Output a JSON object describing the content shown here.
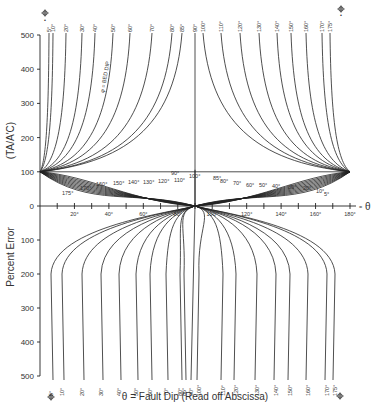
{
  "chart_data": {
    "type": "line",
    "title": "",
    "xlabel": "θ = Fault Dip (Read off Abscissa)",
    "ylabel_top": "(TA/A'C)",
    "ylabel_bottom": "Percent Error",
    "x_axis_symbol": "= θ",
    "x_ticks": [
      20,
      40,
      60,
      80,
      100,
      120,
      140,
      160,
      180
    ],
    "x_tick_labels": [
      "20°",
      "40°",
      "60°",
      "80°",
      "100°",
      "120°",
      "140°",
      "160°",
      "180°"
    ],
    "xlim": [
      0,
      180
    ],
    "y_ticks_top": [
      0,
      100,
      200,
      300,
      400,
      500
    ],
    "y_ticks_bottom": [
      0,
      100,
      200,
      300,
      400,
      500
    ],
    "ylim_top": [
      0,
      500
    ],
    "ylim_bottom": [
      0,
      500
    ],
    "grid": false,
    "series_parameter": "φ = BED DIP",
    "annotation_top_left": "φ = BED DIP",
    "top_curve_labels": [
      "5°",
      "10°",
      "20°",
      "30°",
      "40°",
      "50°",
      "60°",
      "70°",
      "80°",
      "85°",
      "90°",
      "100°",
      "110°",
      "120°",
      "130°",
      "140°",
      "150°",
      "160°",
      "170°",
      "175°"
    ],
    "bottom_curve_labels": [
      "5°",
      "10°",
      "20°",
      "30°",
      "40°",
      "50°",
      "60°",
      "70°",
      "80°",
      "85°",
      "90°",
      "100°",
      "110°",
      "120°",
      "130°",
      "140°",
      "150°",
      "160°",
      "170°",
      "175°"
    ],
    "middle_left_labels": [
      "175°",
      "170°",
      "160°",
      "150°",
      "140°",
      "130°",
      "120°",
      "110°",
      "100°",
      "90°"
    ],
    "middle_right_labels": [
      "85°",
      "80°",
      "70°",
      "60°",
      "50°",
      "40°",
      "30°",
      "20°",
      "10°",
      "5°"
    ],
    "phi_values": [
      5,
      10,
      20,
      30,
      40,
      50,
      60,
      70,
      80,
      85,
      90,
      100,
      110,
      120,
      130,
      140,
      150,
      160,
      170,
      175
    ],
    "convergence_points": [
      {
        "theta": 0,
        "percent": 100
      },
      {
        "theta": 180,
        "percent": 100
      },
      {
        "theta": 90,
        "percent": 0
      }
    ]
  },
  "labels": {
    "y_top": "(TA/A'C)",
    "y_bottom": "Percent Error",
    "x_axis": "θ = Fault Dip (Read off Abscissa)",
    "theta_symbol": "θ",
    "theta_eq": "= θ",
    "bed_dip": "φ = BED DIP",
    "phi_marker_top_left": "φ =",
    "phi_marker_top_right": "φ =",
    "phi_marker_bottom_left": "φ =",
    "phi_marker_bottom_right": "φ =",
    "center_90": "90°"
  }
}
